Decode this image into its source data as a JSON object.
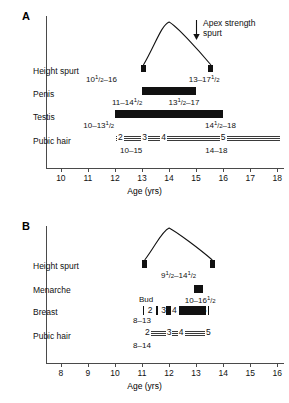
{
  "figure": {
    "panels": [
      {
        "id": "A",
        "letter": "A",
        "subject": "boys",
        "axis": {
          "title": "Age (yrs)",
          "min": 9.45,
          "max": 18.25,
          "ticks": [
            10,
            11,
            12,
            13,
            14,
            15,
            16,
            17,
            18
          ],
          "tick_labels": [
            "10",
            "11",
            "12",
            "13",
            "14",
            "15",
            "16",
            "17",
            "18"
          ]
        },
        "annotation": {
          "line1": "Apex strength",
          "line2": "spurt",
          "icon": "arrow-down-icon"
        },
        "rows": [
          {
            "label": "Height spurt",
            "type": "curve",
            "start": 13.05,
            "end": 15.55,
            "peak": 14.0,
            "left_range": "10½–16",
            "left_range_parts": {
              "whole": "10",
              "num": "1",
              "den": "2",
              "tail": "–16"
            },
            "right_range": "13–17½",
            "right_range_parts": {
              "lead": "13–17",
              "num": "1",
              "den": "2"
            }
          },
          {
            "label": "Penis",
            "type": "bar",
            "start": 13.0,
            "end": 15.0,
            "left_range": "11–14½",
            "left_range_parts": {
              "lead": "11–14",
              "num": "1",
              "den": "2"
            },
            "right_range": "13½–17",
            "right_range_parts": {
              "whole": "13",
              "num": "1",
              "den": "2",
              "tail": "–17"
            }
          },
          {
            "label": "Testis",
            "type": "bar",
            "start": 12.0,
            "end": 16.0,
            "left_range": "10–13½",
            "left_range_parts": {
              "lead": "10–13",
              "num": "1",
              "den": "2"
            },
            "right_range": "14½–18",
            "right_range_parts": {
              "whole": "14",
              "num": "1",
              "den": "2",
              "tail": "–18"
            }
          },
          {
            "label": "Pubic hair",
            "type": "track",
            "start": 12.05,
            "end": 18.1,
            "stages": [
              "2",
              "3",
              "4",
              "5"
            ],
            "stage_positions": [
              12.2,
              13.1,
              13.8,
              16.0
            ],
            "left_range": "10–15",
            "right_range": "14–18"
          }
        ]
      },
      {
        "id": "B",
        "letter": "B",
        "subject": "girls",
        "axis": {
          "title": "Age (yrs)",
          "min": 7.45,
          "max": 16.25,
          "ticks": [
            8,
            9,
            10,
            11,
            12,
            13,
            14,
            15,
            16
          ],
          "tick_labels": [
            "8",
            "9",
            "10",
            "11",
            "12",
            "13",
            "14",
            "15",
            "16"
          ]
        },
        "rows": [
          {
            "label": "Height spurt",
            "type": "curve",
            "start": 11.1,
            "end": 13.6,
            "peak": 12.0,
            "center_range": "9½–14½",
            "center_range_parts": {
              "whole": "9",
              "num": "1",
              "den": "2",
              "mid": "–14",
              "num2": "1",
              "den2": "2"
            }
          },
          {
            "label": "Menarche",
            "type": "marker",
            "position": 13.1,
            "range": "10–16½",
            "range_parts": {
              "lead": "10–16",
              "num": "1",
              "den": "2"
            }
          },
          {
            "label": "Breast",
            "type": "breast",
            "bud_label": "Bud",
            "bud_position": 11.15,
            "stages": [
              "2",
              "3",
              "4",
              "5"
            ],
            "left_range": "8–13",
            "ticks_positions": [
              11.05,
              11.55,
              12.05,
              13.45
            ],
            "segments": [
              {
                "start": 11.9,
                "end": 12.05
              },
              {
                "start": 12.35,
                "end": 13.35
              }
            ]
          },
          {
            "label": "Pubic hair",
            "type": "track",
            "start": 11.1,
            "end": 13.6,
            "stages": [
              "2",
              "3",
              "4",
              "5"
            ],
            "stage_positions": [
              11.2,
              12.0,
              12.45,
              13.45
            ],
            "left_range": "8–14"
          }
        ]
      }
    ]
  }
}
